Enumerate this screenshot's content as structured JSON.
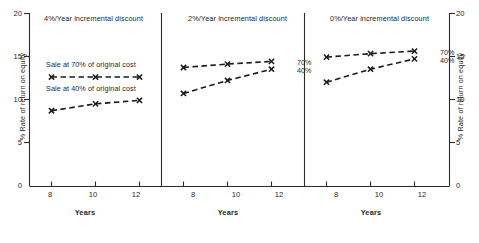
{
  "chart_data": {
    "type": "line",
    "title": "",
    "xlabel": "Years",
    "ylabel": "% Rate of return on equity",
    "ylabel_right": "% Rate of return on equity",
    "x": [
      8,
      10,
      12
    ],
    "xlim": [
      7,
      13
    ],
    "ylim": [
      0,
      20
    ],
    "yticks": [
      0,
      5,
      10,
      15,
      20
    ],
    "xticks": [
      8,
      10,
      12
    ],
    "grid": false,
    "legend_position": "inline-annotations",
    "marker": "x",
    "linestyle": "dashed",
    "panels": [
      {
        "title": "4%/Year incremental discount",
        "series": [
          {
            "name": "Sale at 70% of original cost",
            "annotation": "Sale at 70% of original cost",
            "end_label": "",
            "values": [
              12.6,
              12.6,
              12.6
            ]
          },
          {
            "name": "Sale at 40% of original cost",
            "annotation": "Sale at 40% of original cost",
            "end_label": "",
            "values": [
              8.7,
              9.5,
              9.9
            ]
          }
        ]
      },
      {
        "title": "2%/Year incremental discount",
        "series": [
          {
            "name": "Sale at 70% of original cost",
            "annotation": "",
            "end_label": "70%",
            "values": [
              13.7,
              14.1,
              14.4
            ]
          },
          {
            "name": "Sale at 40% of original cost",
            "annotation": "",
            "end_label": "40%",
            "values": [
              10.7,
              12.2,
              13.5
            ]
          }
        ]
      },
      {
        "title": "0%/Year incremental discount",
        "series": [
          {
            "name": "Sale at 70% of original cost",
            "annotation": "",
            "end_label": "70%",
            "values": [
              14.9,
              15.3,
              15.6
            ]
          },
          {
            "name": "Sale at 40% of original cost",
            "annotation": "",
            "end_label": "40%",
            "values": [
              12.0,
              13.5,
              14.7
            ]
          }
        ]
      }
    ]
  },
  "axes": {
    "y_left_ticks": [
      "20",
      "15",
      "10",
      "5",
      "0"
    ],
    "y_right_ticks": [
      "20",
      "15",
      "10",
      "5",
      "0"
    ],
    "x_ticks": [
      "8",
      "10",
      "12"
    ],
    "x_title": "Years",
    "y_title_left": "% Rate of return on equity",
    "y_title_right": "% Rate of return on equity"
  },
  "panel1": {
    "title": "4%/Year incremental discount",
    "note_70": "Sale at 70% of original cost",
    "note_40": "Sale at 40% of original cost"
  },
  "panel2": {
    "title": "2%/Year incremental discount",
    "label_70": "70%",
    "label_40": "40%"
  },
  "panel3": {
    "title": "0%/Year incremental discount",
    "label_70": "70%",
    "label_40": "40%"
  },
  "colors": {
    "ink": "#1a1a1a",
    "background": "#ffffff"
  }
}
